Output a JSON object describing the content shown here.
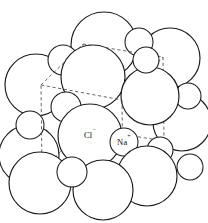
{
  "figure": {
    "background_color": "#ffffff",
    "sphere_fill": "#ffffff",
    "sphere_stroke": "#1a1a1a",
    "unit_cell_stroke": "#555555",
    "label_color": "#111111"
  },
  "labels": {
    "chloride": "Cl",
    "chloride_charge": "−",
    "chloride_full": "Cl−",
    "sodium": "Na",
    "sodium_charge": "+",
    "sodium_full": "Na+"
  },
  "label_positions": {
    "chloride": {
      "x": 90,
      "y": 136
    },
    "sodium": {
      "x": 124,
      "y": 142
    }
  },
  "unit_cell": {
    "shape": "cube",
    "line_style": "dashed",
    "vertices": {
      "front_top_left": {
        "x": 41,
        "y": 85
      },
      "front_top_right": {
        "x": 122,
        "y": 100
      },
      "front_bottom_left": {
        "x": 42,
        "y": 170
      },
      "front_bottom_right": {
        "x": 123,
        "y": 183
      },
      "back_top_left": {
        "x": 83,
        "y": 44
      },
      "back_top_right": {
        "x": 163,
        "y": 57
      },
      "back_bottom_left": {
        "x": 84,
        "y": 128
      },
      "back_bottom_right": {
        "x": 164,
        "y": 141
      }
    },
    "edges": [
      [
        "front_top_left",
        "front_top_right"
      ],
      [
        "front_top_right",
        "front_bottom_right"
      ],
      [
        "front_bottom_right",
        "front_bottom_left"
      ],
      [
        "front_bottom_left",
        "front_top_left"
      ],
      [
        "back_top_left",
        "back_top_right"
      ],
      [
        "back_top_right",
        "back_bottom_right"
      ],
      [
        "back_bottom_right",
        "back_bottom_left"
      ],
      [
        "back_bottom_left",
        "back_top_left"
      ],
      [
        "front_top_left",
        "back_top_left"
      ],
      [
        "front_top_right",
        "back_top_right"
      ],
      [
        "front_bottom_left",
        "back_bottom_left"
      ],
      [
        "front_bottom_right",
        "back_bottom_right"
      ]
    ]
  },
  "spheres": {
    "chloride_radius": 31,
    "sodium_radius": 14,
    "back_layer": [
      {
        "id": "cl-back-1",
        "ion": "Cl",
        "x": 104,
        "y": 45,
        "r": 33
      },
      {
        "id": "cl-back-2",
        "ion": "Cl",
        "x": 170,
        "y": 58,
        "r": 30
      },
      {
        "id": "cl-back-3",
        "ion": "Cl",
        "x": 36,
        "y": 85,
        "r": 31
      },
      {
        "id": "na-back-1",
        "ion": "Na",
        "x": 63,
        "y": 60,
        "r": 15
      },
      {
        "id": "na-back-2",
        "ion": "Na",
        "x": 139,
        "y": 42,
        "r": 14
      },
      {
        "id": "na-back-3",
        "ion": "Na",
        "x": 188,
        "y": 96,
        "r": 13
      },
      {
        "id": "cl-back-4",
        "ion": "Cl",
        "x": 182,
        "y": 122,
        "r": 29
      },
      {
        "id": "na-back-4",
        "ion": "Na",
        "x": 30,
        "y": 125,
        "r": 14
      }
    ],
    "middle_layer": [
      {
        "id": "cl-mid-1",
        "ion": "Cl",
        "x": 93,
        "y": 77,
        "r": 32
      },
      {
        "id": "cl-mid-2",
        "ion": "Cl",
        "x": 150,
        "y": 96,
        "r": 29
      },
      {
        "id": "na-mid-1",
        "ion": "Na",
        "x": 66,
        "y": 107,
        "r": 15
      },
      {
        "id": "na-mid-2",
        "ion": "Na",
        "x": 146,
        "y": 60,
        "r": 13
      },
      {
        "id": "cl-mid-3",
        "ion": "Cl",
        "x": 29,
        "y": 155,
        "r": 30
      },
      {
        "id": "na-mid-3",
        "ion": "Na",
        "x": 160,
        "y": 150,
        "r": 13
      }
    ],
    "front_layer": [
      {
        "id": "cl-front-1",
        "ion": "Cl",
        "x": 90,
        "y": 136,
        "r": 32,
        "label": "Cl"
      },
      {
        "id": "na-front-1",
        "ion": "Na",
        "x": 124,
        "y": 142,
        "r": 14,
        "label": "Na"
      },
      {
        "id": "cl-front-2",
        "ion": "Cl",
        "x": 147,
        "y": 176,
        "r": 30
      },
      {
        "id": "cl-front-3",
        "ion": "Cl",
        "x": 103,
        "y": 190,
        "r": 30
      },
      {
        "id": "cl-front-4",
        "ion": "Cl",
        "x": 40,
        "y": 183,
        "r": 31
      },
      {
        "id": "na-front-2",
        "ion": "Na",
        "x": 72,
        "y": 172,
        "r": 15
      },
      {
        "id": "na-front-3",
        "ion": "Na",
        "x": 190,
        "y": 167,
        "r": 13
      }
    ]
  }
}
